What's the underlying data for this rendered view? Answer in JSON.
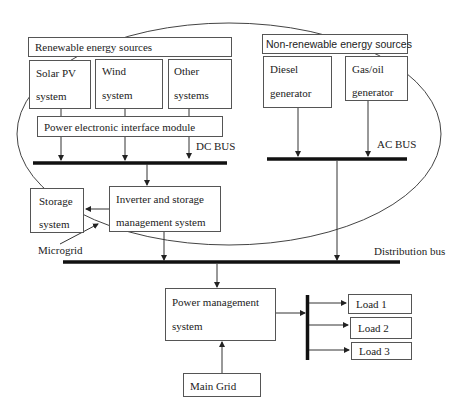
{
  "diagram": {
    "microgrid_label": "Microgrid",
    "renewable": {
      "header": "Renewable energy sources",
      "sources": [
        {
          "line1": "Solar PV",
          "line2": "system"
        },
        {
          "line1": "Wind",
          "line2": "system"
        },
        {
          "line1": "Other",
          "line2": "systems"
        }
      ],
      "interface_module": "Power electronic interface module",
      "bus_label": "DC BUS"
    },
    "non_renewable": {
      "header": "Non-renewable energy sources",
      "sources": [
        {
          "line1": "Diesel",
          "line2": "generator"
        },
        {
          "line1": "Gas/oil",
          "line2": "generator"
        }
      ],
      "bus_label": "AC BUS"
    },
    "storage": {
      "line1": "Storage",
      "line2": "system"
    },
    "inverter": {
      "line1": "Inverter and storage",
      "line2": "management system"
    },
    "distribution_bus_label": "Distribution bus",
    "power_management": {
      "line1": "Power management",
      "line2": "system"
    },
    "main_grid": "Main Grid",
    "loads": [
      "Load 1",
      "Load 2",
      "Load 3"
    ]
  }
}
